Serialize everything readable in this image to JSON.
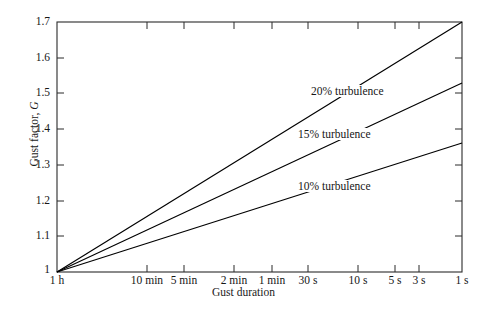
{
  "chart_data": {
    "type": "line",
    "title": "",
    "xlabel": "Gust duration",
    "ylabel": "Gust factor, G",
    "ylim": [
      1.0,
      1.7
    ],
    "ytick_values": [
      "1",
      "1.1",
      "1.2",
      "1.3",
      "1.4",
      "1.5",
      "1.6",
      "1.7"
    ],
    "xtick_labels": [
      "1 h",
      "10 min",
      "5 min",
      "2 min",
      "1 min",
      "30 s",
      "10 s",
      "5 s",
      "3 s",
      "1 s"
    ],
    "xtick_seconds": [
      3600,
      600,
      300,
      120,
      60,
      30,
      10,
      5,
      3,
      1
    ],
    "grid": false,
    "legend_position": "inline-annotations",
    "series": [
      {
        "name": "20% turbulence",
        "label": "20% turbulence",
        "color": "#000000",
        "x": [
          "1 h",
          "1 s"
        ],
        "values": [
          1.0,
          1.7
        ]
      },
      {
        "name": "15% turbulence",
        "label": "15% turbulence",
        "color": "#000000",
        "x": [
          "1 h",
          "1 s"
        ],
        "values": [
          1.0,
          1.53
        ]
      },
      {
        "name": "10% turbulence",
        "label": "10% turbulence",
        "color": "#000000",
        "x": [
          "1 h",
          "1 s"
        ],
        "values": [
          1.0,
          1.36
        ]
      }
    ],
    "annotations": [
      {
        "text": "20% turbulence",
        "x_px": 340,
        "y_px": 92
      },
      {
        "text": "15% turbulence",
        "x_px": 327,
        "y_px": 134
      },
      {
        "text": "10% turbulence",
        "x_px": 327,
        "y_px": 186
      }
    ]
  },
  "axes": {
    "origin_label": "1",
    "y_ticks": [
      {
        "label": "1.7",
        "y_px": 22
      },
      {
        "label": "1.6",
        "y_px": 58
      },
      {
        "label": "1.5",
        "y_px": 93
      },
      {
        "label": "1.4",
        "y_px": 129
      },
      {
        "label": "1.3",
        "y_px": 165
      },
      {
        "label": "1.2",
        "y_px": 201
      },
      {
        "label": "1.1",
        "y_px": 236
      },
      {
        "label": "1",
        "y_px": 272
      }
    ],
    "x_ticks": [
      {
        "label": "1 h",
        "x_px": 57
      },
      {
        "label": "10 min",
        "x_px": 147
      },
      {
        "label": "5 min",
        "x_px": 184
      },
      {
        "label": "2 min",
        "x_px": 234
      },
      {
        "label": "1 min",
        "x_px": 272
      },
      {
        "label": "30 s",
        "x_px": 308
      },
      {
        "label": "10 s",
        "x_px": 358
      },
      {
        "label": "5 s",
        "x_px": 395
      },
      {
        "label": "3 s",
        "x_px": 419
      },
      {
        "label": "1 s",
        "x_px": 462
      }
    ]
  },
  "colors": {
    "frame": "#2b2b2b",
    "line": "#000000",
    "text": "#161616",
    "background": "#ffffff"
  }
}
